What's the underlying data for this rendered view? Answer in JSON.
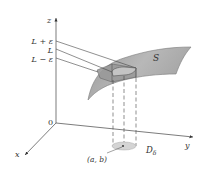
{
  "figure": {
    "type": "3d-limit-diagram",
    "axes": {
      "x_label": "x",
      "y_label": "y",
      "z_label": "z",
      "origin_label": "0"
    },
    "z_levels": [
      {
        "id": "upper",
        "label": "L + ε"
      },
      {
        "id": "mid",
        "label": "L"
      },
      {
        "id": "lower",
        "label": "L − ε"
      }
    ],
    "surface_label": "S",
    "point_label": "(a, b)",
    "disk_label": "D",
    "disk_subscript": "δ",
    "colors": {
      "surface": "#a8a8a8",
      "surface_edge": "#7a7a7a",
      "axis": "#444444",
      "disk": "#d4d4d4",
      "background": "#ffffff"
    }
  }
}
